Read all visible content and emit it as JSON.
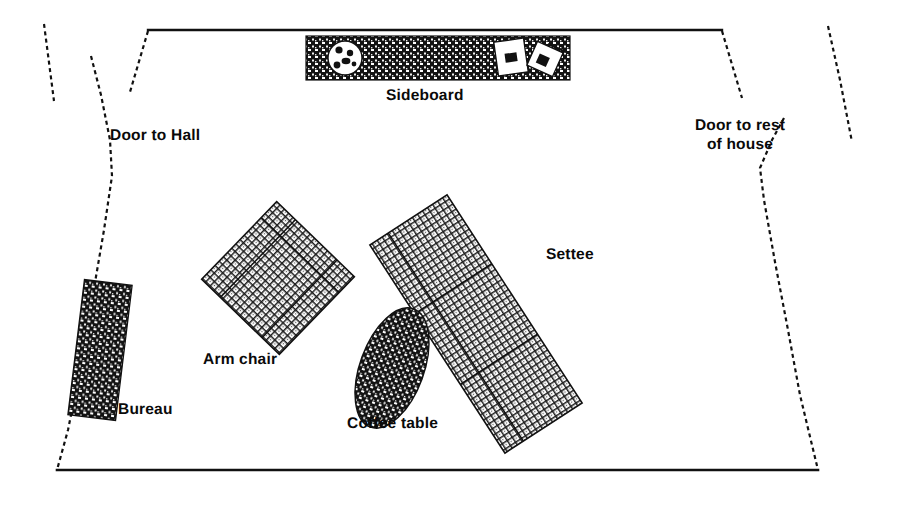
{
  "diagram": {
    "type": "floor-plan",
    "background_color": "#ffffff",
    "line_color": "#111111",
    "labels": {
      "sideboard": "Sideboard",
      "door_to_hall": "Door to Hall",
      "door_to_rest_of_house": "Door to rest\nof house",
      "settee": "Settee",
      "arm_chair": "Arm chair",
      "bureau": "Bureau",
      "coffee_table": "Coffee table"
    },
    "walls": [
      {
        "name": "top-wall",
        "style": "solid",
        "from": [
          148,
          30
        ],
        "to": [
          722,
          30
        ]
      },
      {
        "name": "bottom-wall",
        "style": "solid",
        "from": [
          57,
          470
        ],
        "to": [
          818,
          470
        ]
      },
      {
        "name": "left-wall-upper-door-jamb",
        "style": "dashed",
        "from": [
          148,
          30
        ],
        "to": [
          130,
          90
        ]
      },
      {
        "name": "left-doorway-outer",
        "style": "dashed",
        "from": [
          44,
          25
        ],
        "to": [
          53,
          100
        ]
      },
      {
        "name": "left-wall-lower",
        "style": "dashed",
        "from": [
          90,
          55
        ],
        "to": [
          112,
          170
        ]
      },
      {
        "name": "left-wall-run",
        "style": "dashed",
        "from": [
          112,
          170
        ],
        "to": [
          57,
          470
        ]
      },
      {
        "name": "right-wall-upper-door-jamb",
        "style": "dashed",
        "from": [
          722,
          30
        ],
        "to": [
          740,
          96
        ]
      },
      {
        "name": "right-doorway-outer",
        "style": "dashed",
        "from": [
          836,
          28
        ],
        "to": [
          850,
          140
        ]
      },
      {
        "name": "right-wall-lower",
        "style": "dashed",
        "from": [
          758,
          170
        ],
        "to": [
          780,
          118
        ]
      },
      {
        "name": "right-wall-run",
        "style": "dashed",
        "from": [
          758,
          170
        ],
        "to": [
          818,
          470
        ]
      }
    ],
    "furniture": [
      {
        "name": "sideboard",
        "shape": "rectangle",
        "fill": "dark-hatch",
        "x": 306,
        "y": 36,
        "width": 264,
        "height": 44,
        "rotation": 0
      },
      {
        "name": "tray-on-sideboard",
        "shape": "circle",
        "cx": 345,
        "cy": 58,
        "r": 17,
        "fill": "white",
        "dots": 5
      },
      {
        "name": "papers-on-sideboard",
        "shape": "rectangles",
        "count": 2,
        "fill": "white"
      },
      {
        "name": "bureau",
        "shape": "rectangle",
        "fill": "dark-hatch",
        "x": 78,
        "y": 282,
        "width": 46,
        "height": 136,
        "rotation": 8
      },
      {
        "name": "arm-chair",
        "shape": "square",
        "fill": "light-hatch",
        "x": 224,
        "y": 222,
        "width": 108,
        "height": 108,
        "rotation": 42
      },
      {
        "name": "settee",
        "shape": "rectangle",
        "fill": "light-hatch",
        "x": 430,
        "y": 200,
        "width": 92,
        "height": 248,
        "rotation": -34
      },
      {
        "name": "coffee-table",
        "shape": "ellipse",
        "fill": "dark-hatch",
        "cx": 392,
        "cy": 368,
        "rx": 32,
        "ry": 62,
        "rotation": 20
      }
    ]
  }
}
